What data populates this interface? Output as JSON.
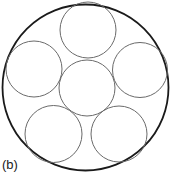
{
  "figure": {
    "label": "(b)",
    "outer_circle": {
      "cx": 85.5,
      "cy": 87.5,
      "r": 83,
      "stroke": "#1a1a1a",
      "stroke_width": 1.8
    },
    "inner_circles": [
      {
        "name": "center",
        "cx": 87,
        "cy": 88,
        "r": 28
      },
      {
        "name": "top",
        "cx": 88,
        "cy": 30,
        "r": 28
      },
      {
        "name": "upper-left",
        "cx": 34,
        "cy": 69,
        "r": 28
      },
      {
        "name": "upper-right",
        "cx": 140,
        "cy": 70,
        "r": 27.5
      },
      {
        "name": "lower-left",
        "cx": 53.5,
        "cy": 134,
        "r": 28.5
      },
      {
        "name": "lower-right",
        "cx": 119,
        "cy": 134,
        "r": 28
      }
    ],
    "inner_stroke": "#6a6a6a",
    "inner_stroke_width": 1
  }
}
